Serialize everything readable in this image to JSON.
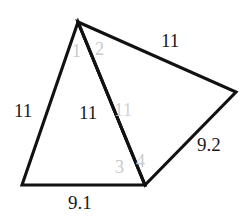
{
  "figure": {
    "background_color": "#ffffff",
    "stroke_color": "#111111",
    "faint_color": "#c9c9c9",
    "vertices": {
      "apex": [
        78,
        22
      ],
      "bottom_left": [
        22,
        185
      ],
      "bottom_middle": [
        145,
        185
      ],
      "right": [
        236,
        92
      ]
    },
    "edges": [
      {
        "name": "left-side",
        "from": "apex",
        "to": "bottom_left"
      },
      {
        "name": "bottom-side",
        "from": "bottom_left",
        "to": "bottom_middle"
      },
      {
        "name": "cevian",
        "from": "apex",
        "to": "bottom_middle"
      },
      {
        "name": "top-right-side",
        "from": "apex",
        "to": "right"
      },
      {
        "name": "lower-right-side",
        "from": "right",
        "to": "bottom_middle"
      }
    ]
  },
  "side_labels": {
    "left": "11",
    "cevian": "11",
    "top_right": "11",
    "lower_right": "9.2",
    "bottom": "9.1"
  },
  "angle_labels": {
    "one": "1",
    "two": "2",
    "three": "3",
    "four": "4"
  },
  "ghost_labels": {
    "cevian_echo": "11"
  }
}
